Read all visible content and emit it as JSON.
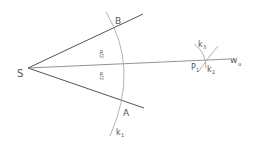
{
  "diagram": {
    "labels": {
      "vertex": "S",
      "point_b": "B",
      "point_a": "A",
      "point_p": "P",
      "point_p_sub": "1",
      "arc_k1": "k",
      "arc_k1_sub": "1",
      "arc_k2": "k",
      "arc_k2_sub": "2",
      "arc_k3": "k",
      "arc_k3_sub": "3",
      "bisector": "w",
      "bisector_sub": "α",
      "half_angle_upper": "α/2",
      "half_angle_lower": "α/2"
    },
    "colors": {
      "line": "#555555",
      "arc": "#aaaaaa",
      "text": "#555555"
    }
  }
}
